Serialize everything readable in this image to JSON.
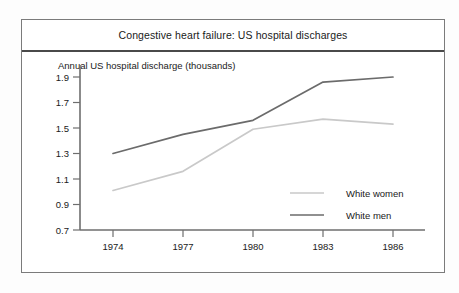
{
  "chart_data": {
    "type": "line",
    "title": "Congestive heart failure: US hospital discharges",
    "xlabel": "",
    "ylabel": "Annual US hospital discharge (thousands)",
    "x": [
      1974,
      1977,
      1980,
      1983,
      1986
    ],
    "xtick_labels": [
      "1974",
      "1977",
      "1980",
      "1983",
      "1986"
    ],
    "ytick_labels": [
      "0.7",
      "0.9",
      "1.1",
      "1.3",
      "1.5",
      "1.7",
      "1.9"
    ],
    "ytick_values": [
      0.7,
      0.9,
      1.1,
      1.3,
      1.5,
      1.7,
      1.9
    ],
    "ylim": [
      0.7,
      1.9
    ],
    "xlim": [
      1974,
      1986
    ],
    "grid": false,
    "legend_position": "inside-lower-right",
    "series": [
      {
        "name": "White women",
        "color": "#c9c9c9",
        "values": [
          1.01,
          1.16,
          1.49,
          1.57,
          1.53
        ]
      },
      {
        "name": "White men",
        "color": "#6b6b6b",
        "values": [
          1.3,
          1.45,
          1.56,
          1.86,
          1.9
        ]
      }
    ]
  },
  "legend": {
    "entries": [
      {
        "label": "White women"
      },
      {
        "label": "White men"
      }
    ]
  },
  "colors": {
    "frame": "#7b7b7b",
    "title_rule": "#4a4a4a",
    "axis": "#6e6e6e",
    "text": "#1a1a1a",
    "background": "#ffffff",
    "page_background": "#fdfdfd"
  }
}
